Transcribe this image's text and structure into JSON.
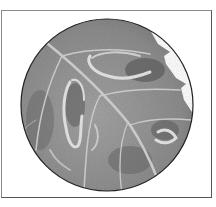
{
  "image": {
    "subject": "magnified leaf with leaf-miner trails",
    "view": "circular magnifier view",
    "palette": {
      "background": "#ffffff",
      "frame": "#7a7a7a",
      "circle_outline": "#222222",
      "leaf_base": "#8f8f8f",
      "leaf_dark": "#5e5e5e",
      "vein": "#cfcfcf",
      "mine_trail": "#d8d8d8"
    },
    "circle": {
      "cx": 107,
      "cy": 105,
      "r": 86
    }
  }
}
